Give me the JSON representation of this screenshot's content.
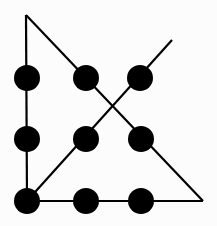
{
  "diagram": {
    "background_color": "#fcfcfc",
    "stroke_color": "#000000",
    "dot_color": "#000000",
    "stroke_width": 2.2,
    "dot_radius": 13,
    "dots": [
      {
        "row": 1,
        "col": 1,
        "cx": 27,
        "cy": 78
      },
      {
        "row": 1,
        "col": 2,
        "cx": 86,
        "cy": 78
      },
      {
        "row": 1,
        "col": 3,
        "cx": 140,
        "cy": 78
      },
      {
        "row": 2,
        "col": 1,
        "cx": 27,
        "cy": 139
      },
      {
        "row": 2,
        "col": 2,
        "cx": 86,
        "cy": 139
      },
      {
        "row": 2,
        "col": 3,
        "cx": 141,
        "cy": 139
      },
      {
        "row": 3,
        "col": 1,
        "cx": 27,
        "cy": 201
      },
      {
        "row": 3,
        "col": 2,
        "cx": 86,
        "cy": 201
      },
      {
        "row": 3,
        "col": 3,
        "cx": 141,
        "cy": 201
      }
    ],
    "lines": [
      {
        "name": "left-vertical",
        "x1": 26,
        "y1": 15,
        "x2": 27,
        "y2": 201
      },
      {
        "name": "bottom-horizontal",
        "x1": 27,
        "y1": 201,
        "x2": 203,
        "y2": 201
      },
      {
        "name": "descending-diagonal",
        "x1": 26,
        "y1": 15,
        "x2": 203,
        "y2": 201
      },
      {
        "name": "ascending-diagonal",
        "x1": 27,
        "y1": 201,
        "x2": 172,
        "y2": 40
      }
    ]
  }
}
